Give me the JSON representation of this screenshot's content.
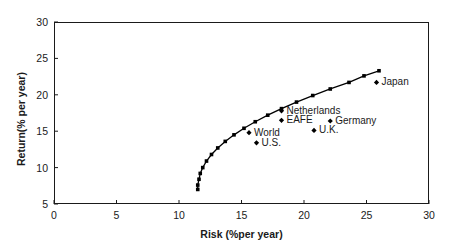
{
  "chart_data": {
    "type": "scatter",
    "title": "",
    "subtitle": "",
    "xlabel": "Risk (%per year)",
    "ylabel": "Return(% per year)",
    "xlim": [
      0,
      30
    ],
    "ylim": [
      5,
      30
    ],
    "xticks": [
      0,
      5,
      10,
      15,
      20,
      25,
      30
    ],
    "yticks": [
      5,
      10,
      15,
      20,
      25,
      30
    ],
    "grid": false,
    "legend_position": "none",
    "series": [
      {
        "name": "Efficient frontier",
        "type": "line",
        "marker": "square",
        "points": [
          [
            11.5,
            7.0
          ],
          [
            11.5,
            7.6
          ],
          [
            11.6,
            8.4
          ],
          [
            11.7,
            9.2
          ],
          [
            11.9,
            10.0
          ],
          [
            12.2,
            10.9
          ],
          [
            12.6,
            11.8
          ],
          [
            13.1,
            12.7
          ],
          [
            13.7,
            13.6
          ],
          [
            14.4,
            14.5
          ],
          [
            15.2,
            15.4
          ],
          [
            16.1,
            16.3
          ],
          [
            17.1,
            17.2
          ],
          [
            18.2,
            18.1
          ],
          [
            19.4,
            19.0
          ],
          [
            20.7,
            19.9
          ],
          [
            22.1,
            20.8
          ],
          [
            23.6,
            21.7
          ],
          [
            24.8,
            22.6
          ],
          [
            26.0,
            23.3
          ]
        ]
      },
      {
        "name": "Country indexes",
        "type": "scatter",
        "marker": "diamond",
        "points": [
          {
            "label": "Netherlands",
            "x": 18.2,
            "y": 17.8,
            "label_pos": "right"
          },
          {
            "label": "EAFE",
            "x": 18.2,
            "y": 16.5,
            "label_pos": "right"
          },
          {
            "label": "Germany",
            "x": 22.1,
            "y": 16.4,
            "label_pos": "right"
          },
          {
            "label": "U.K.",
            "x": 20.8,
            "y": 15.1,
            "label_pos": "right"
          },
          {
            "label": "Japan",
            "x": 25.8,
            "y": 21.7,
            "label_pos": "right"
          },
          {
            "label": "World",
            "x": 15.6,
            "y": 14.8,
            "label_pos": "right"
          },
          {
            "label": "U.S.",
            "x": 16.2,
            "y": 13.4,
            "label_pos": "right"
          }
        ]
      }
    ]
  },
  "axes": {
    "x_tick_labels": [
      "0",
      "5",
      "10",
      "15",
      "20",
      "25",
      "30"
    ],
    "y_tick_labels": [
      "5",
      "10",
      "15",
      "20",
      "25",
      "30"
    ],
    "x_axis_title": "Risk (%per year)",
    "y_axis_title": "Return(% per year)"
  },
  "colors": {
    "axis": "#1a1a1a",
    "frontier_line": "#000000",
    "frontier_marker": "#000000",
    "index_marker": "#000000",
    "background": "#ffffff",
    "text": "#1a1a1a"
  }
}
